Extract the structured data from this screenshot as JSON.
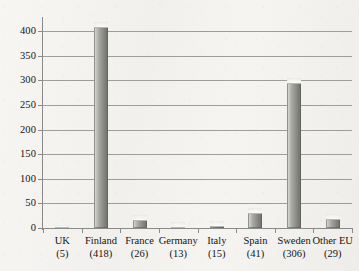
{
  "chart_data": {
    "type": "bar",
    "title": "",
    "subtitle": "",
    "xlabel": "",
    "ylabel": "",
    "categories": [
      "UK",
      "Finland",
      "France",
      "Germany",
      "Italy",
      "Spain",
      "Sweden",
      "Other EU"
    ],
    "category_values": [
      5,
      418,
      26,
      13,
      15,
      41,
      306,
      29
    ],
    "category_value_labels": [
      "(5)",
      "(418)",
      "(26)",
      "(13)",
      "(15)",
      "(41)",
      "(306)",
      "(29)"
    ],
    "values": [
      5,
      418,
      26,
      13,
      15,
      41,
      306,
      29
    ],
    "ylim": [
      0,
      425
    ],
    "yticks": [
      0,
      50,
      100,
      150,
      200,
      250,
      300,
      350,
      400
    ],
    "ytick_labels": [
      "0",
      "50",
      "100",
      "150",
      "200",
      "250",
      "300",
      "350",
      "400"
    ],
    "grid": true,
    "legend": false,
    "legend_position": "none",
    "bar_color": "#8f8f89",
    "grid_color": "#8e8e8e",
    "axis_color": "#8a8a8a",
    "background_color": "#f4f3f0",
    "text_color": "#141414"
  },
  "caption": {
    "text": ""
  }
}
